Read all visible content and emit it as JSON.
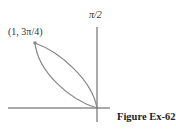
{
  "figure": {
    "caption": "Figure Ex-62",
    "axis_label_vertical": "π/2",
    "point_label": "(1, 3π/4)",
    "colors": {
      "curve": "#8a8a8a",
      "axes": "#444444",
      "point": "#8a8a8a",
      "text": "#333333"
    }
  },
  "diagram": {
    "type": "polar-curve",
    "marked_point": {
      "r": 1,
      "theta": "3π/4",
      "label": "(1, 3π/4)"
    },
    "axes": [
      "polar axis (horizontal)",
      "π/2 axis (vertical)"
    ]
  }
}
